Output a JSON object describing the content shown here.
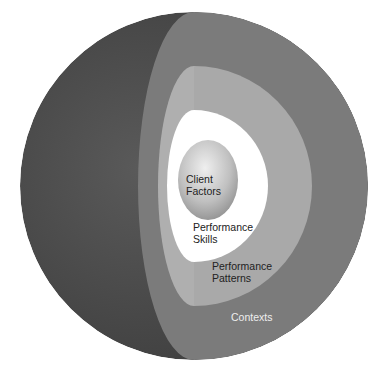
{
  "diagram": {
    "type": "nested-sphere",
    "layers": [
      {
        "id": "client-factors",
        "label_lines": [
          "Client",
          "Factors"
        ],
        "color": "#b5b5b5"
      },
      {
        "id": "performance-skills",
        "label_lines": [
          "Performance",
          "Skills"
        ],
        "color": "#ffffff"
      },
      {
        "id": "performance-patterns",
        "label_lines": [
          "Performance",
          "Patterns"
        ],
        "color": "#a9a9a9"
      },
      {
        "id": "contexts",
        "label_lines": [
          "Contexts"
        ],
        "color": "#7b7b7b"
      }
    ],
    "outer_color": "#4a4a4a"
  }
}
